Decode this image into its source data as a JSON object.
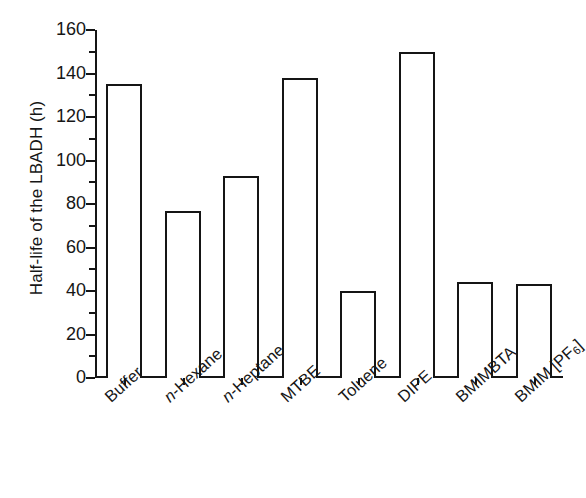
{
  "chart_data": {
    "type": "bar",
    "title": "",
    "subtitle": "",
    "xlabel": "",
    "ylabel": "Half-life of the LBADH (h)",
    "categories": [
      "Buffer",
      "n-Hexane",
      "n-Heptane",
      "MTBE",
      "Toluene",
      "DIPE",
      "BMIMBTA",
      "BMIM [PF6]"
    ],
    "category_labels_html": [
      "Buffer",
      "<i>n</i>-Hexane",
      "<i>n</i>-Heptane",
      "MTBE",
      "Toluene",
      "DIPE",
      "BMIMBTA",
      "BMIM [PF<sub>6</sub>]"
    ],
    "values": [
      135,
      77,
      93,
      138,
      40,
      150,
      44,
      43
    ],
    "ylim": [
      0,
      160
    ],
    "ytick_labels": [
      "0",
      "20",
      "40",
      "60",
      "80",
      "100",
      "120",
      "140",
      "160"
    ],
    "ytick_values": [
      0,
      20,
      40,
      60,
      80,
      100,
      120,
      140,
      160
    ],
    "yminor_step": 10,
    "grid": "off",
    "legend": "none",
    "bar_fill_color": "#ffffff",
    "bar_edge_color": "#151515",
    "axis_color": "#151515",
    "background_color": "#ffffff",
    "xtick_label_rotation": -42
  }
}
